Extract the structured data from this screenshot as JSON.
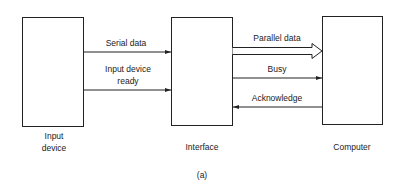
{
  "blocks": {
    "input_device": {
      "label_line1": "Input",
      "label_line2": "device"
    },
    "interface": {
      "label": "Interface"
    },
    "computer": {
      "label": "Computer"
    }
  },
  "signals": {
    "serial_data": {
      "label": "Serial data",
      "direction": "input_device_to_interface"
    },
    "input_device_ready": {
      "label_line1": "Input device",
      "label_line2": "ready",
      "direction": "input_device_to_interface"
    },
    "parallel_data": {
      "label": "Parallel data",
      "direction": "interface_to_computer",
      "style": "hollow-bus-arrow"
    },
    "busy": {
      "label": "Busy",
      "direction": "interface_to_computer"
    },
    "acknowledge": {
      "label": "Acknowledge",
      "direction": "computer_to_interface"
    }
  },
  "caption": "(a)"
}
